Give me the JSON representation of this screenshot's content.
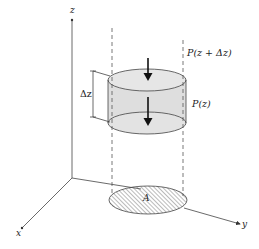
{
  "diagram": {
    "axes": {
      "z_label": "z",
      "x_label": "x",
      "y_label": "y"
    },
    "labels": {
      "top_pressure": "P(z + Δz)",
      "bottom_pressure": "P(z)",
      "thickness": "Δz",
      "area": "A"
    },
    "colors": {
      "line": "#333333",
      "cylinder_fill": "#dedede",
      "ellipse_fill": "#e6e6e6",
      "hatch": "#555555",
      "background": "#ffffff"
    }
  }
}
